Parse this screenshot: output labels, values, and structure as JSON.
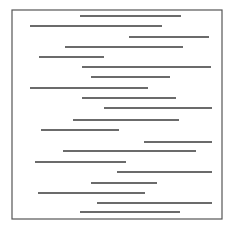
{
  "figure": {
    "width": 233,
    "height": 231,
    "background": "#ffffff",
    "frame": {
      "x1": 12,
      "y1": 10,
      "x2": 222,
      "y2": 219,
      "stroke": "#555555",
      "stroke_width": 1.2
    },
    "line_color": "#3a3a3a",
    "line_width": 1.3,
    "segments": [
      {
        "y": 16,
        "x1": 80,
        "x2": 181
      },
      {
        "y": 26,
        "x1": 30,
        "x2": 162
      },
      {
        "y": 37,
        "x1": 129,
        "x2": 209
      },
      {
        "y": 47,
        "x1": 65,
        "x2": 183
      },
      {
        "y": 57,
        "x1": 39,
        "x2": 104
      },
      {
        "y": 67,
        "x1": 82,
        "x2": 211
      },
      {
        "y": 77,
        "x1": 91,
        "x2": 170
      },
      {
        "y": 88,
        "x1": 30,
        "x2": 148
      },
      {
        "y": 98,
        "x1": 82,
        "x2": 176
      },
      {
        "y": 108,
        "x1": 104,
        "x2": 212
      },
      {
        "y": 120,
        "x1": 73,
        "x2": 179
      },
      {
        "y": 130,
        "x1": 41,
        "x2": 119
      },
      {
        "y": 142,
        "x1": 144,
        "x2": 212
      },
      {
        "y": 151,
        "x1": 63,
        "x2": 196
      },
      {
        "y": 162,
        "x1": 35,
        "x2": 126
      },
      {
        "y": 172,
        "x1": 117,
        "x2": 212
      },
      {
        "y": 183,
        "x1": 91,
        "x2": 157
      },
      {
        "y": 193,
        "x1": 38,
        "x2": 145
      },
      {
        "y": 203,
        "x1": 97,
        "x2": 212
      },
      {
        "y": 212,
        "x1": 80,
        "x2": 180
      }
    ]
  }
}
